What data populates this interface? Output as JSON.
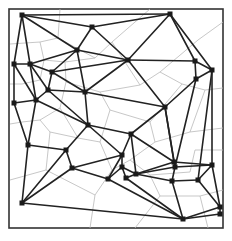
{
  "diagram": {
    "type": "delaunay-voronoi",
    "frame": {
      "x": 9,
      "y": 9,
      "width": 214,
      "height": 219
    },
    "colors": {
      "delaunay_edges": "#222222",
      "voronoi_edges": "#b9b9b9",
      "points": "#1a1a1a",
      "frame": "#333333",
      "background": "#ffffff"
    },
    "points": [
      [
        22,
        15
      ],
      [
        170,
        14
      ],
      [
        92,
        27
      ],
      [
        77,
        50
      ],
      [
        14,
        64
      ],
      [
        30,
        64
      ],
      [
        52,
        72
      ],
      [
        128,
        60
      ],
      [
        85,
        92
      ],
      [
        48,
        90
      ],
      [
        36,
        100
      ],
      [
        195,
        61
      ],
      [
        212,
        70
      ],
      [
        196,
        79
      ],
      [
        165,
        107
      ],
      [
        14,
        103
      ],
      [
        28,
        145
      ],
      [
        66,
        150
      ],
      [
        88,
        125
      ],
      [
        72,
        168
      ],
      [
        122,
        155
      ],
      [
        131,
        134
      ],
      [
        108,
        179
      ],
      [
        122,
        167
      ],
      [
        126,
        178
      ],
      [
        136,
        174
      ],
      [
        174,
        162
      ],
      [
        175,
        167
      ],
      [
        212,
        165
      ],
      [
        198,
        180
      ],
      [
        183,
        219
      ],
      [
        22,
        203
      ],
      [
        220,
        207
      ],
      [
        220,
        214
      ],
      [
        172,
        181
      ]
    ],
    "edges": [
      [
        0,
        1
      ],
      [
        0,
        2
      ],
      [
        0,
        4
      ],
      [
        0,
        5
      ],
      [
        0,
        3
      ],
      [
        2,
        1
      ],
      [
        2,
        3
      ],
      [
        2,
        7
      ],
      [
        1,
        7
      ],
      [
        1,
        11
      ],
      [
        1,
        12
      ],
      [
        3,
        5
      ],
      [
        3,
        6
      ],
      [
        3,
        7
      ],
      [
        3,
        8
      ],
      [
        5,
        4
      ],
      [
        5,
        6
      ],
      [
        5,
        9
      ],
      [
        5,
        10
      ],
      [
        4,
        15
      ],
      [
        4,
        10
      ],
      [
        6,
        9
      ],
      [
        6,
        8
      ],
      [
        6,
        7
      ],
      [
        7,
        11
      ],
      [
        7,
        8
      ],
      [
        7,
        14
      ],
      [
        11,
        12
      ],
      [
        11,
        13
      ],
      [
        12,
        13
      ],
      [
        13,
        14
      ],
      [
        12,
        29
      ],
      [
        12,
        28
      ],
      [
        13,
        27
      ],
      [
        8,
        9
      ],
      [
        8,
        18
      ],
      [
        8,
        14
      ],
      [
        9,
        10
      ],
      [
        9,
        18
      ],
      [
        10,
        15
      ],
      [
        10,
        16
      ],
      [
        10,
        18
      ],
      [
        15,
        16
      ],
      [
        16,
        17
      ],
      [
        16,
        31
      ],
      [
        17,
        18
      ],
      [
        17,
        19
      ],
      [
        17,
        31
      ],
      [
        18,
        20
      ],
      [
        18,
        21
      ],
      [
        14,
        21
      ],
      [
        14,
        26
      ],
      [
        14,
        27
      ],
      [
        21,
        20
      ],
      [
        21,
        26
      ],
      [
        20,
        19
      ],
      [
        20,
        22
      ],
      [
        20,
        23
      ],
      [
        19,
        22
      ],
      [
        19,
        31
      ],
      [
        22,
        23
      ],
      [
        23,
        24
      ],
      [
        24,
        25
      ],
      [
        23,
        25
      ],
      [
        22,
        30
      ],
      [
        25,
        26
      ],
      [
        25,
        27
      ],
      [
        26,
        27
      ],
      [
        27,
        28
      ],
      [
        27,
        34
      ],
      [
        28,
        29
      ],
      [
        28,
        32
      ],
      [
        29,
        34
      ],
      [
        29,
        32
      ],
      [
        34,
        30
      ],
      [
        30,
        32
      ],
      [
        30,
        33
      ],
      [
        32,
        33
      ],
      [
        31,
        30
      ],
      [
        24,
        30
      ],
      [
        25,
        34
      ],
      [
        21,
        25
      ],
      [
        26,
        28
      ]
    ],
    "voronoi_segments": [
      [
        [
          60,
          9
        ],
        [
          58,
          38
        ]
      ],
      [
        [
          58,
          38
        ],
        [
          40,
          42
        ]
      ],
      [
        [
          40,
          42
        ],
        [
          10,
          44
        ]
      ],
      [
        [
          58,
          38
        ],
        [
          95,
          58
        ]
      ],
      [
        [
          95,
          58
        ],
        [
          112,
          42
        ]
      ],
      [
        [
          112,
          42
        ],
        [
          150,
          9
        ]
      ],
      [
        [
          112,
          42
        ],
        [
          140,
          85
        ]
      ],
      [
        [
          140,
          85
        ],
        [
          160,
          72
        ]
      ],
      [
        [
          160,
          72
        ],
        [
          198,
          40
        ]
      ],
      [
        [
          198,
          40
        ],
        [
          223,
          22
        ]
      ],
      [
        [
          160,
          72
        ],
        [
          182,
          84
        ]
      ],
      [
        [
          182,
          84
        ],
        [
          205,
          90
        ]
      ],
      [
        [
          205,
          90
        ],
        [
          223,
          88
        ]
      ],
      [
        [
          40,
          42
        ],
        [
          44,
          60
        ]
      ],
      [
        [
          44,
          60
        ],
        [
          40,
          80
        ]
      ],
      [
        [
          40,
          80
        ],
        [
          22,
          84
        ]
      ],
      [
        [
          22,
          84
        ],
        [
          10,
          84
        ]
      ],
      [
        [
          44,
          60
        ],
        [
          65,
          62
        ]
      ],
      [
        [
          65,
          62
        ],
        [
          95,
          58
        ]
      ],
      [
        [
          65,
          62
        ],
        [
          66,
          82
        ]
      ],
      [
        [
          66,
          82
        ],
        [
          100,
          92
        ]
      ],
      [
        [
          100,
          92
        ],
        [
          140,
          85
        ]
      ],
      [
        [
          66,
          82
        ],
        [
          60,
          108
        ]
      ],
      [
        [
          60,
          108
        ],
        [
          40,
          120
        ]
      ],
      [
        [
          40,
          120
        ],
        [
          22,
          122
        ]
      ],
      [
        [
          22,
          122
        ],
        [
          10,
          124
        ]
      ],
      [
        [
          60,
          108
        ],
        [
          78,
          138
        ]
      ],
      [
        [
          78,
          138
        ],
        [
          50,
          132
        ]
      ],
      [
        [
          50,
          132
        ],
        [
          40,
          120
        ]
      ],
      [
        [
          78,
          138
        ],
        [
          100,
          142
        ]
      ],
      [
        [
          100,
          142
        ],
        [
          110,
          110
        ]
      ],
      [
        [
          110,
          110
        ],
        [
          100,
          92
        ]
      ],
      [
        [
          110,
          110
        ],
        [
          150,
          122
        ]
      ],
      [
        [
          150,
          122
        ],
        [
          182,
          84
        ]
      ],
      [
        [
          150,
          122
        ],
        [
          155,
          142
        ]
      ],
      [
        [
          155,
          142
        ],
        [
          190,
          132
        ]
      ],
      [
        [
          190,
          132
        ],
        [
          205,
          90
        ]
      ],
      [
        [
          190,
          132
        ],
        [
          223,
          128
        ]
      ],
      [
        [
          50,
          132
        ],
        [
          46,
          170
        ]
      ],
      [
        [
          46,
          170
        ],
        [
          10,
          180
        ]
      ],
      [
        [
          46,
          170
        ],
        [
          95,
          195
        ]
      ],
      [
        [
          95,
          195
        ],
        [
          112,
          170
        ]
      ],
      [
        [
          112,
          170
        ],
        [
          100,
          142
        ]
      ],
      [
        [
          95,
          195
        ],
        [
          90,
          228
        ]
      ],
      [
        [
          112,
          170
        ],
        [
          130,
          160
        ]
      ],
      [
        [
          130,
          160
        ],
        [
          155,
          142
        ]
      ],
      [
        [
          130,
          160
        ],
        [
          150,
          175
        ]
      ],
      [
        [
          150,
          175
        ],
        [
          160,
          196
        ]
      ],
      [
        [
          160,
          196
        ],
        [
          135,
          228
        ]
      ],
      [
        [
          160,
          196
        ],
        [
          200,
          196
        ]
      ],
      [
        [
          200,
          196
        ],
        [
          223,
          190
        ]
      ],
      [
        [
          200,
          196
        ],
        [
          208,
          228
        ]
      ],
      [
        [
          150,
          175
        ],
        [
          190,
          172
        ]
      ],
      [
        [
          190,
          172
        ],
        [
          195,
          150
        ]
      ],
      [
        [
          195,
          150
        ],
        [
          223,
          150
        ]
      ]
    ]
  }
}
